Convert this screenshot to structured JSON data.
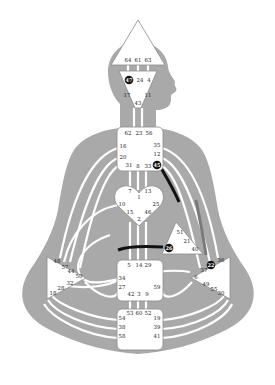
{
  "colors": {
    "body": "#a9a9a9",
    "channel": "#ffffff",
    "active_channel": "#111111",
    "partial_channel": "#7a7a7a",
    "center_fill": "#ffffff",
    "active_gate": "#111111"
  },
  "centers": {
    "head": {
      "gates": [
        "64",
        "61",
        "63"
      ]
    },
    "ajna": {
      "gates": [
        "47",
        "24",
        "4",
        "17",
        "11",
        "43"
      ],
      "active": [
        "47"
      ]
    },
    "throat": {
      "gates": [
        "62",
        "23",
        "56",
        "16",
        "35",
        "20",
        "12",
        "45",
        "31",
        "8",
        "33"
      ],
      "active": [
        "45"
      ]
    },
    "g": {
      "gates": [
        "7",
        "13",
        "1",
        "10",
        "25",
        "15",
        "46",
        "2"
      ]
    },
    "ego": {
      "gates": [
        "51",
        "21",
        "26",
        "40"
      ],
      "active": [
        "26"
      ]
    },
    "spleen": {
      "gates": [
        "48",
        "57",
        "44",
        "50",
        "32",
        "28",
        "18"
      ]
    },
    "sacral": {
      "gates": [
        "5",
        "14",
        "29",
        "34",
        "27",
        "59",
        "42",
        "3",
        "9"
      ]
    },
    "solar_plexus": {
      "gates": [
        "22",
        "36",
        "37",
        "6",
        "49",
        "55",
        "30"
      ],
      "active": [
        "22"
      ]
    },
    "root": {
      "gates": [
        "53",
        "60",
        "52",
        "54",
        "19",
        "38",
        "39",
        "58",
        "41"
      ]
    }
  }
}
